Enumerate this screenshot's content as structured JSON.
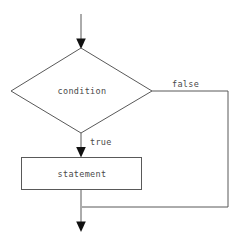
{
  "diagram": {
    "background_color": "#ffffff",
    "stroke_color": "#595959",
    "arrow_color": "#111111",
    "text_color": "#4a4a4a",
    "nodes": {
      "decision": {
        "label": "condition",
        "shape": "diamond"
      },
      "process": {
        "label": "statement",
        "shape": "rectangle"
      }
    },
    "edges": {
      "entry": {
        "label": ""
      },
      "true_branch": {
        "label": "true"
      },
      "false_branch": {
        "label": "false"
      },
      "exit": {
        "label": ""
      }
    }
  }
}
